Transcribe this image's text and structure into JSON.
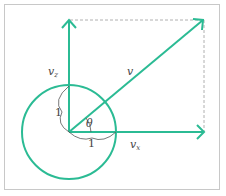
{
  "diagram": {
    "labels": {
      "v": "v",
      "v_y": "v",
      "v_y_sub": "z",
      "v_x": "v",
      "v_x_sub": "x",
      "theta": "θ",
      "unit_x": "1",
      "unit_y": "1"
    },
    "colors": {
      "vector": "#2bbb94",
      "dashed": "#b0b0b0",
      "arc": "#555555",
      "border": "#c8c8c8"
    }
  }
}
